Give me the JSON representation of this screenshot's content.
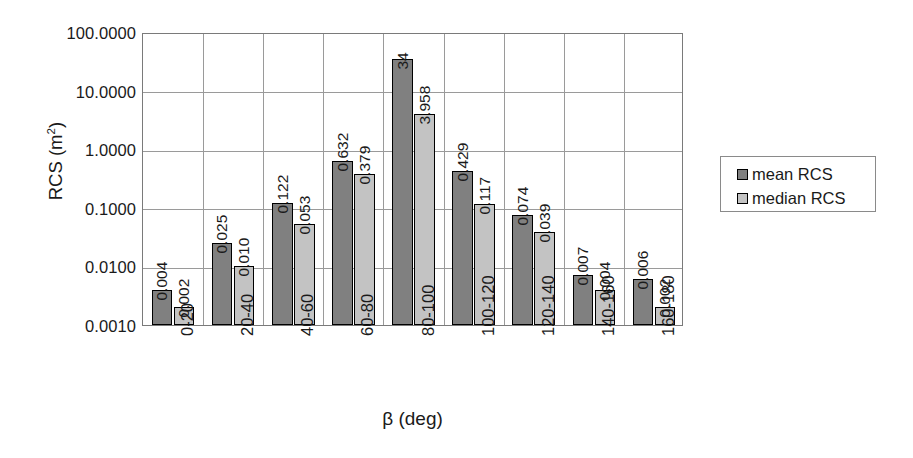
{
  "chart_data": {
    "type": "bar",
    "title": "",
    "xlabel": "β (deg)",
    "ylabel": "RCS (m²)",
    "ylabel_base": "RCS (m",
    "ylabel_sup": "2",
    "ylabel_tail": ")",
    "yscale": "log",
    "ylim": [
      0.001,
      100
    ],
    "grid": true,
    "legend_position": "right",
    "categories": [
      "0-20",
      "20-40",
      "40-60",
      "60-80",
      "80-100",
      "100-120",
      "120-140",
      "140-160",
      "160-180"
    ],
    "ytick_labels": [
      "100.0000",
      "10.0000",
      "1.0000",
      "0.1000",
      "0.0100",
      "0.0010"
    ],
    "ytick_values": [
      100,
      10,
      1,
      0.1,
      0.01,
      0.001
    ],
    "series": [
      {
        "name": "mean RCS",
        "color": "#808080",
        "values": [
          0.004,
          0.025,
          0.122,
          0.632,
          34,
          0.429,
          0.074,
          0.007,
          0.006
        ],
        "labels": [
          "0.004",
          "0.025",
          "0.122",
          "0.632",
          "34",
          "0.429",
          "0.074",
          "0.007",
          "0.006"
        ]
      },
      {
        "name": "median RCS",
        "color": "#c3c3c3",
        "values": [
          0.002,
          0.01,
          0.053,
          0.379,
          3.958,
          0.117,
          0.039,
          0.004,
          0.002
        ],
        "labels": [
          "0.002",
          "0.010",
          "0.053",
          "0.379",
          "3.958",
          "0.117",
          "0.039",
          "0.004",
          "0.002"
        ]
      }
    ]
  },
  "legend": {
    "items": [
      {
        "label": "mean RCS",
        "color": "#808080"
      },
      {
        "label": "median RCS",
        "color": "#c3c3c3"
      }
    ]
  }
}
